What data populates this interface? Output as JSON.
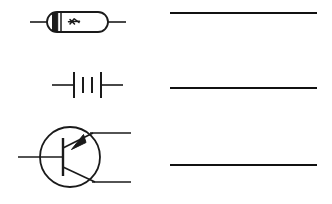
{
  "page": {
    "background_color": "#ffffff",
    "ink_color": "#1a1a1a",
    "width": 332,
    "height": 204
  },
  "symbols": [
    {
      "id": "symbol-1",
      "name": "diode-symbol",
      "label": "Diode",
      "description": "Axial capsule body with cathode band and marking, leads on both sides",
      "row": 1,
      "center_y": 22
    },
    {
      "id": "symbol-2",
      "name": "battery-symbol",
      "label": "Battery",
      "description": "Two-cell battery: long plate, short plate, short plate, long plate with leads",
      "row": 2,
      "center_y": 85
    },
    {
      "id": "symbol-3",
      "name": "pnp-transistor-symbol",
      "label": "PNP Transistor",
      "description": "Circle enclosing base bar, emitter with arrow pointing inward to base, and collector",
      "row": 3,
      "center_y": 157
    }
  ],
  "answer_lines": [
    {
      "id": "answer-line-1",
      "name": "answer-line-1",
      "value": "",
      "y": 13,
      "x_start": 170,
      "x_end": 317
    },
    {
      "id": "answer-line-2",
      "name": "answer-line-2",
      "value": "",
      "y": 88,
      "x_start": 170,
      "x_end": 317
    },
    {
      "id": "answer-line-3",
      "name": "answer-line-3",
      "value": "",
      "y": 165,
      "x_start": 170,
      "x_end": 317
    }
  ]
}
